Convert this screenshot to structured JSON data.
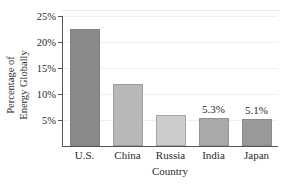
{
  "chart_data": {
    "type": "bar",
    "title": "",
    "subtitle": "",
    "xlabel": "Country",
    "ylabel": "Percentage of Energy Globally",
    "ylabel_lines": [
      "Percentage of",
      "Energy Globally"
    ],
    "categories": [
      "U.S.",
      "China",
      "Russia",
      "India",
      "Japan"
    ],
    "values": [
      22.5,
      12.0,
      5.9,
      5.3,
      5.1
    ],
    "value_labels": [
      "",
      "",
      "",
      "5.3%",
      "5.1%"
    ],
    "bar_colors": [
      "#8a8a8a",
      "#b8b8b8",
      "#cccccc",
      "#a9a9a9",
      "#999999"
    ],
    "ylim": [
      0,
      25
    ],
    "yticks": [
      5,
      10,
      15,
      20,
      25
    ],
    "ytick_labels": [
      "5%",
      "10%",
      "15%",
      "20%",
      "25%"
    ],
    "grid": true,
    "legend": "none"
  }
}
